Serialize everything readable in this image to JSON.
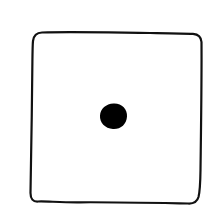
{
  "image": {
    "subject": "die-face",
    "pip_count": 1,
    "description": "Hand-drawn die face showing one pip",
    "colors": {
      "background": "#ffffff",
      "stroke": "#111111",
      "pip": "#000000"
    }
  }
}
